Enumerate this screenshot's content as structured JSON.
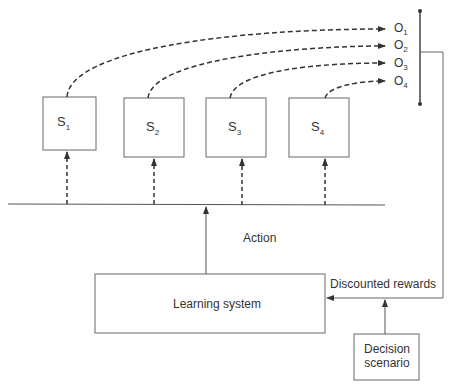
{
  "diagram": {
    "states": [
      {
        "label": "S",
        "sub": "1"
      },
      {
        "label": "S",
        "sub": "2"
      },
      {
        "label": "S",
        "sub": "3"
      },
      {
        "label": "S",
        "sub": "4"
      }
    ],
    "outcomes": [
      {
        "label": "O",
        "sub": "1"
      },
      {
        "label": "O",
        "sub": "2"
      },
      {
        "label": "O",
        "sub": "3"
      },
      {
        "label": "O",
        "sub": "4"
      }
    ],
    "action_label": "Action",
    "learning_system_label": "Learning system",
    "rewards_label": "Discounted rewards",
    "decision_label_line1": "Decision",
    "decision_label_line2": "scenario",
    "colors": {
      "line": "#555555",
      "dash": "#333333",
      "text": "#333333"
    }
  }
}
